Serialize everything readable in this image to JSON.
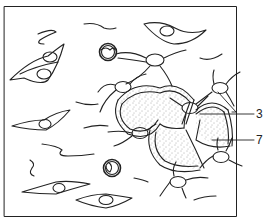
{
  "figure": {
    "labels": [
      {
        "id": "label-3",
        "text": "3",
        "target": "stellate cell processes"
      },
      {
        "id": "label-7",
        "text": "7",
        "target": "stippled matrix"
      }
    ],
    "colors": {
      "line": "#222222",
      "background": "#ffffff",
      "stipple": "#555555"
    }
  }
}
